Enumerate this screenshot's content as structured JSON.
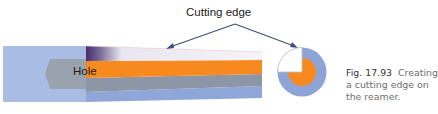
{
  "figure": {
    "labels": {
      "cutting_edge": "Cutting edge",
      "hole": "Hole"
    },
    "caption": {
      "number": "Fig. 17.93",
      "text": "Creating a cutting edge on the reamer."
    },
    "colors": {
      "workpiece_blue": "#a9bce3",
      "hole_gray": "#9aa3ad",
      "reamer_orange": "#f7891f",
      "reamer_gray": "#8c96a6",
      "reamer_blue": "#8fa6d8",
      "gradient_dark": "#4a2a72",
      "gradient_light": "#f6f4f8",
      "arrow": "#3f4f7c",
      "circle_outer": "#8ea4d6",
      "circle_inner": "#f7891f"
    }
  }
}
